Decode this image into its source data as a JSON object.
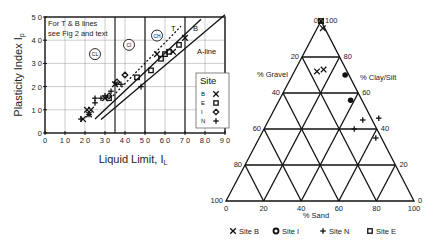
{
  "chart_data": [
    {
      "type": "scatter",
      "title": "Plasticity chart",
      "xlabel": "Liquid Limit, I_L",
      "ylabel": "Plasticity Index I_p",
      "xlim": [
        0,
        90
      ],
      "ylim": [
        0,
        50
      ],
      "x_ticks": [
        "0",
        "10",
        "20",
        "30",
        "40",
        "50",
        "60",
        "70",
        "80",
        "90"
      ],
      "y_ticks": [
        "0",
        "10",
        "20",
        "30",
        "40",
        "50"
      ],
      "grid": true,
      "annotation": [
        "For T & B lines",
        "see Fig 2 and text"
      ],
      "zone_labels": [
        {
          "text": "CL",
          "x": 25,
          "y": 34
        },
        {
          "text": "CI",
          "x": 42,
          "y": 38
        },
        {
          "text": "CH",
          "x": 56,
          "y": 42
        }
      ],
      "line_labels": [
        {
          "text": "T",
          "x": 63,
          "y": 44
        },
        {
          "text": "B",
          "x": 74,
          "y": 44
        },
        {
          "text": "A-line",
          "x": 76,
          "y": 34
        }
      ],
      "vertical_lines": [
        35,
        50,
        70
      ],
      "lines": [
        {
          "name": "A-line",
          "points": [
            [
              28,
              5.8
            ],
            [
              90,
              51
            ]
          ],
          "style": "solid"
        },
        {
          "name": "B",
          "points": [
            [
              25,
              6
            ],
            [
              78,
              49
            ]
          ],
          "style": "solid"
        },
        {
          "name": "T",
          "points": [
            [
              34,
              16
            ],
            [
              68,
              46
            ]
          ],
          "style": "dotted"
        }
      ],
      "legend": {
        "title": "Site",
        "position": "lower right",
        "entries": [
          {
            "label": "B",
            "marker": "x"
          },
          {
            "label": "E",
            "marker": "square"
          },
          {
            "label": "I",
            "marker": "diamond"
          },
          {
            "label": "N",
            "marker": "plus"
          }
        ]
      },
      "series": [
        {
          "name": "B",
          "marker": "x",
          "points": [
            [
              19,
              6
            ],
            [
              21,
              10
            ],
            [
              22,
              8
            ],
            [
              23,
              10
            ],
            [
              30,
              15
            ],
            [
              35,
              21
            ],
            [
              56,
              34
            ],
            [
              64,
              35
            ],
            [
              70,
              41
            ]
          ]
        },
        {
          "name": "E",
          "marker": "square",
          "points": [
            [
              32,
              15
            ],
            [
              46,
              24
            ],
            [
              53,
              27
            ],
            [
              58,
              32
            ],
            [
              60,
              34
            ],
            [
              62,
              35
            ],
            [
              67,
              38
            ]
          ]
        },
        {
          "name": "I",
          "marker": "diamond",
          "points": [
            [
              32,
              16
            ],
            [
              36,
              22
            ],
            [
              40,
              25
            ]
          ]
        },
        {
          "name": "N",
          "marker": "plus",
          "points": [
            [
              18,
              6
            ],
            [
              22,
              8
            ],
            [
              25,
              13
            ],
            [
              25,
              15
            ],
            [
              28,
              15
            ],
            [
              30,
              16
            ],
            [
              33,
              18
            ],
            [
              38,
              21
            ],
            [
              48,
              20
            ]
          ]
        }
      ]
    },
    {
      "type": "ternary",
      "axis_labels": {
        "left": "% Gravel",
        "right": "% Clay/Silt",
        "bottom": "% Sand"
      },
      "left_ticks": [
        "0",
        "20",
        "40",
        "60",
        "80",
        "100"
      ],
      "right_ticks": [
        "100",
        "80",
        "60",
        "40",
        "20",
        "0"
      ],
      "bottom_ticks": [
        "0",
        "20",
        "40",
        "60",
        "80",
        "100"
      ],
      "legend": [
        {
          "label": "Site B",
          "marker": "x"
        },
        {
          "label": "Site I",
          "marker": "diamond"
        },
        {
          "label": "Site N",
          "marker": "plus"
        },
        {
          "label": "Site E",
          "marker": "square"
        }
      ],
      "series": [
        {
          "name": "Site B",
          "marker": "x",
          "points": [
            {
              "sand": 0,
              "clay": 100
            },
            {
              "sand": 3,
              "clay": 96
            },
            {
              "sand": 12,
              "clay": 72
            },
            {
              "sand": 15,
              "clay": 73
            }
          ]
        },
        {
          "name": "Site E",
          "marker": "square",
          "points": [
            {
              "sand": 0,
              "clay": 100
            }
          ]
        },
        {
          "name": "Site I",
          "marker": "diamond",
          "points": [
            {
              "sand": 28,
              "clay": 70
            },
            {
              "sand": 38,
              "clay": 56
            }
          ]
        },
        {
          "name": "Site N",
          "marker": "plus",
          "points": [
            {
              "sand": 48,
              "clay": 40
            },
            {
              "sand": 50,
              "clay": 45
            },
            {
              "sand": 58,
              "clay": 46
            },
            {
              "sand": 62,
              "clay": 35
            }
          ]
        }
      ]
    }
  ],
  "legend_title": "Site",
  "bottom_legend": [
    "Site B",
    "Site I",
    "Site N",
    "Site E"
  ]
}
